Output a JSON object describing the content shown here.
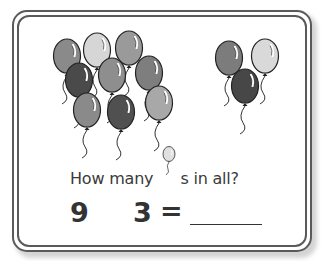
{
  "worksheet": {
    "question": {
      "prefix": "How many",
      "icon": "balloon-icon",
      "suffix": "s in all?"
    },
    "equation": {
      "first_number": "9",
      "operator": "",
      "second_number": "3",
      "equals": "=",
      "answer": ""
    },
    "groups": [
      {
        "name": "left-group",
        "count": 9,
        "balloons": [
          {
            "shade": "#8a8a8a"
          },
          {
            "shade": "#d6d6d6"
          },
          {
            "shade": "#9a9a9a"
          },
          {
            "shade": "#4a4a4a"
          },
          {
            "shade": "#8e8e8e"
          },
          {
            "shade": "#7e7e7e"
          },
          {
            "shade": "#8a8a8a"
          },
          {
            "shade": "#505050"
          },
          {
            "shade": "#a8a8a8"
          }
        ]
      },
      {
        "name": "right-group",
        "count": 3,
        "balloons": [
          {
            "shade": "#7c7c7c"
          },
          {
            "shade": "#d9d9d9"
          },
          {
            "shade": "#474747"
          }
        ]
      }
    ],
    "colors": {
      "border": "#5a5a5a",
      "text": "#3a3a3a",
      "numbers": "#333333"
    }
  }
}
